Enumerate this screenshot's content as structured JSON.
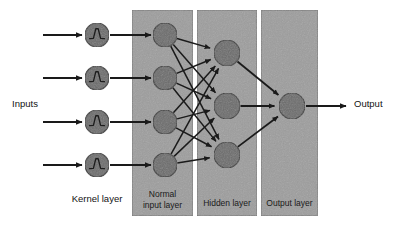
{
  "diagram": {
    "background_color": "#ffffff",
    "panel_color": "#9d9d9d",
    "panel_border_color": "#6e6e6e",
    "node_color": "#6b6b6b",
    "node_border_color": "#3a3a3a",
    "arrow_color": "#1a1a1a",
    "labels": {
      "inputs": "Inputs",
      "output": "Output",
      "kernel_layer": "Kernel layer"
    },
    "panels": [
      {
        "id": "normal-input-layer",
        "label_line1": "Normal",
        "label_line2": "input layer",
        "x": 132,
        "y": 10,
        "width": 61,
        "height": 206
      },
      {
        "id": "hidden-layer",
        "label_line1": "Hidden layer",
        "label_line2": "",
        "x": 197,
        "y": 10,
        "width": 60,
        "height": 206
      },
      {
        "id": "output-layer",
        "label_line1": "Output layer",
        "label_line2": "",
        "x": 261,
        "y": 10,
        "width": 57,
        "height": 206
      }
    ],
    "kernel_nodes": [
      {
        "id": "kernel-node-1",
        "cx": 97,
        "cy": 35,
        "r": 12,
        "glyph": "wavelet-icon"
      },
      {
        "id": "kernel-node-2",
        "cx": 97,
        "cy": 78,
        "r": 12,
        "glyph": "wavelet-icon"
      },
      {
        "id": "kernel-node-3",
        "cx": 97,
        "cy": 122,
        "r": 12,
        "glyph": "wavelet-icon"
      },
      {
        "id": "kernel-node-4",
        "cx": 97,
        "cy": 165,
        "r": 12,
        "glyph": "wavelet-icon"
      }
    ],
    "input_nodes": [
      {
        "id": "input-node-1",
        "cx": 165,
        "cy": 35,
        "r": 12
      },
      {
        "id": "input-node-2",
        "cx": 165,
        "cy": 78,
        "r": 12
      },
      {
        "id": "input-node-3",
        "cx": 165,
        "cy": 122,
        "r": 12
      },
      {
        "id": "input-node-4",
        "cx": 165,
        "cy": 165,
        "r": 12
      }
    ],
    "hidden_nodes": [
      {
        "id": "hidden-node-1",
        "cx": 227,
        "cy": 53,
        "r": 13
      },
      {
        "id": "hidden-node-2",
        "cx": 227,
        "cy": 106,
        "r": 13
      },
      {
        "id": "hidden-node-3",
        "cx": 227,
        "cy": 155,
        "r": 13
      }
    ],
    "output_nodes": [
      {
        "id": "output-node-1",
        "cx": 292,
        "cy": 106,
        "r": 13
      }
    ],
    "input_arrows": [
      {
        "id": "input-arrow-1",
        "x1": 43,
        "y1": 35,
        "x2": 82,
        "y2": 35
      },
      {
        "id": "input-arrow-2",
        "x1": 43,
        "y1": 78,
        "x2": 82,
        "y2": 78
      },
      {
        "id": "input-arrow-3",
        "x1": 43,
        "y1": 122,
        "x2": 82,
        "y2": 122
      },
      {
        "id": "input-arrow-4",
        "x1": 43,
        "y1": 165,
        "x2": 82,
        "y2": 165
      }
    ],
    "kernel_to_input_arrows": [
      {
        "id": "kernel-input-arrow-1",
        "x1": 110,
        "y1": 35,
        "x2": 151,
        "y2": 35
      },
      {
        "id": "kernel-input-arrow-2",
        "x1": 110,
        "y1": 78,
        "x2": 151,
        "y2": 78
      },
      {
        "id": "kernel-input-arrow-3",
        "x1": 110,
        "y1": 122,
        "x2": 151,
        "y2": 122
      },
      {
        "id": "kernel-input-arrow-4",
        "x1": 110,
        "y1": 165,
        "x2": 151,
        "y2": 165
      }
    ],
    "output_arrow": {
      "id": "output-arrow",
      "x1": 306,
      "y1": 106,
      "x2": 346,
      "y2": 106
    },
    "label_positions": {
      "inputs": {
        "x": 12,
        "y": 104
      },
      "output": {
        "x": 354,
        "y": 104
      },
      "kernel_layer": {
        "x": 97,
        "y": 199
      }
    },
    "connections_note": "fully connected input->hidden, hidden->output"
  }
}
